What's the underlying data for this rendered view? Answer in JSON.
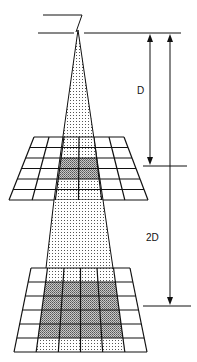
{
  "diagram": {
    "type": "inverse-square-law-beam",
    "labels": {
      "distance_1": "D",
      "distance_2": "2D"
    },
    "colors": {
      "line": "#111111",
      "beam_dots": "#555555",
      "shade_dense": "#8a8a8a",
      "background": "#ffffff"
    },
    "source": {
      "x": 78,
      "y": 30
    },
    "upper_grid": {
      "rows": 6,
      "cols": 6,
      "top_left": [
        34,
        137
      ],
      "top_right": [
        124,
        137
      ],
      "bottom_left": [
        9,
        200
      ],
      "bottom_right": [
        148,
        200
      ],
      "shaded_cols": [
        2,
        3
      ],
      "dense_rows": [
        2,
        3
      ]
    },
    "lower_grid": {
      "rows": 6,
      "cols": 6,
      "top_left": [
        31,
        268
      ],
      "top_right": [
        130,
        268
      ],
      "bottom_left": [
        14,
        352
      ],
      "bottom_right": [
        147,
        352
      ],
      "shaded_cols": [
        1,
        2,
        3,
        4
      ],
      "dense_rows": [
        1,
        2,
        3,
        4
      ]
    }
  }
}
